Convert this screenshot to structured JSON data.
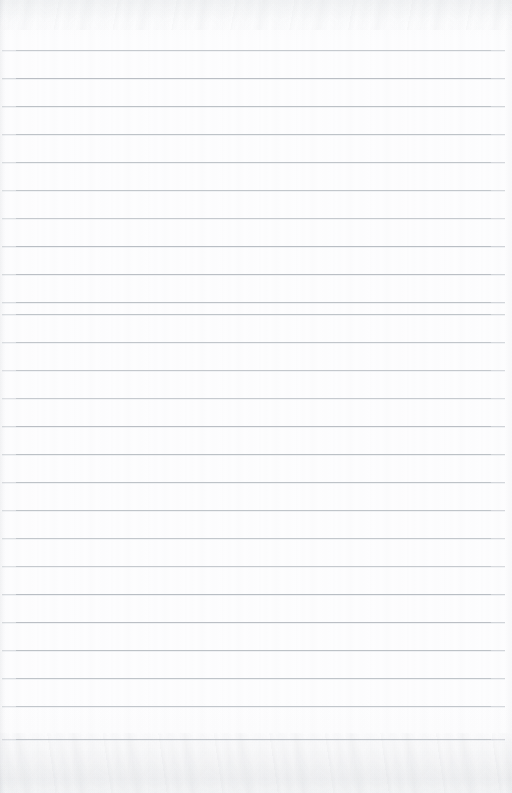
{
  "document": {
    "kind": "ruled-paper-scan",
    "title": "Blank ruled notebook page",
    "content_text": "",
    "written_lines": [],
    "page_width": 512,
    "page_height": 793
  },
  "paper": {
    "background_color": "#fdfdfe",
    "edge_tint_color": "#f8f9fa",
    "grain_color": "#9ba0a8"
  },
  "ruling": {
    "line_color": "#b9bec4",
    "line_thickness": 1,
    "line_spacing": 28,
    "first_line_y": 50,
    "line_start_x": 2,
    "line_end_x": 505,
    "line_count": 26,
    "line_y_positions": [
      50,
      78,
      106,
      134,
      162,
      190,
      218,
      246,
      274,
      302,
      314,
      342,
      370,
      398,
      426,
      454,
      482,
      510,
      538,
      566,
      594,
      622,
      650,
      678,
      706,
      739
    ]
  }
}
